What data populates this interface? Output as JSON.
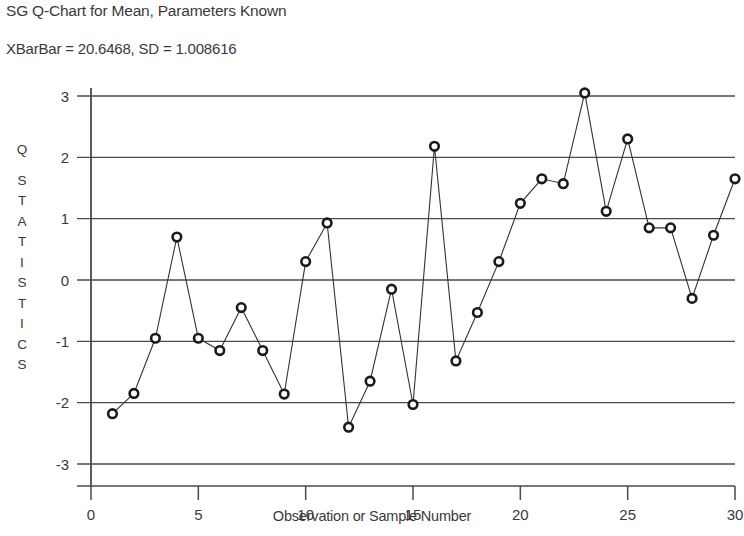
{
  "chart_data": {
    "type": "line",
    "title": "SG Q-Chart for Mean, Parameters Known",
    "subtitle": "XBarBar = 20.6468, SD = 1.008616",
    "xlabel": "Observation or Sample Number",
    "ylabel": "Q STATISTICS",
    "ylabel_lines": [
      "Q",
      "S",
      "T",
      "A",
      "T",
      "I",
      "S",
      "T",
      "I",
      "C",
      "S"
    ],
    "grid": true,
    "legend": "none",
    "xlim": [
      0,
      30
    ],
    "ylim": [
      -3,
      3
    ],
    "xticks": [
      0,
      5,
      10,
      15,
      20,
      25,
      30
    ],
    "xtick_labels": [
      "0",
      "5",
      "10",
      "15",
      "20",
      "25",
      "30"
    ],
    "yticks": [
      -3,
      -2,
      -1,
      0,
      1,
      2,
      3
    ],
    "ytick_labels": [
      "-3",
      "-2",
      "-1",
      "0",
      "1",
      "2",
      "3"
    ],
    "marker": "open-circle",
    "line_color": "#333333",
    "marker_color": "#1a1a1a",
    "grid_color": "#4a4a4a",
    "x": [
      1,
      2,
      3,
      4,
      5,
      6,
      7,
      8,
      9,
      10,
      11,
      12,
      13,
      14,
      15,
      16,
      17,
      18,
      19,
      20,
      21,
      22,
      23,
      24,
      25,
      26,
      27,
      28,
      29,
      30
    ],
    "values": [
      -2.18,
      -1.85,
      -0.95,
      0.7,
      -0.95,
      -1.15,
      -0.45,
      -1.15,
      -1.86,
      0.3,
      0.93,
      -2.4,
      -1.65,
      -0.15,
      -2.03,
      2.18,
      -1.32,
      -0.53,
      0.3,
      1.25,
      1.65,
      1.57,
      3.05,
      1.12,
      2.3,
      0.85,
      0.85,
      -0.3,
      0.73,
      1.65
    ],
    "series": [
      {
        "name": "Q statistic",
        "values": [
          -2.18,
          -1.85,
          -0.95,
          0.7,
          -0.95,
          -1.15,
          -0.45,
          -1.15,
          -1.86,
          0.3,
          0.93,
          -2.4,
          -1.65,
          -0.15,
          -2.03,
          2.18,
          -1.32,
          -0.53,
          0.3,
          1.25,
          1.65,
          1.57,
          3.05,
          1.12,
          2.3,
          0.85,
          0.85,
          -0.3,
          0.73,
          1.65
        ]
      }
    ]
  },
  "plot_geometry": {
    "left": 91,
    "right": 735,
    "top": 96,
    "bottom": 464
  }
}
